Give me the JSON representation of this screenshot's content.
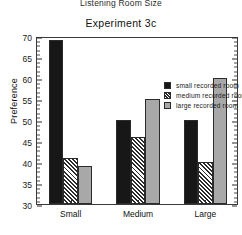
{
  "figure": {
    "supertitle": "Listening Room Size",
    "subtitle": "Experiment 3c"
  },
  "legend": {
    "position": "top-right-inside",
    "entries": [
      {
        "label": "small recorded room",
        "swatch": "black-filled-square-icon"
      },
      {
        "label": "medium recorded room",
        "swatch": "hatched-square-icon"
      },
      {
        "label": "large recorded room",
        "swatch": "gray-filled-square-icon"
      }
    ]
  },
  "axes": {
    "y": {
      "label": "Preference",
      "ticks": [
        "30",
        "35",
        "40",
        "45",
        "50",
        "55",
        "60",
        "65",
        "70"
      ],
      "min": 30,
      "max": 70
    },
    "x": {
      "label": "",
      "ticks": [
        "Small",
        "Medium",
        "Large"
      ]
    }
  },
  "colors": {
    "small_recorded_room": "#171717",
    "medium_recorded_room": "#2b2b2b",
    "large_recorded_room": "#a8a8a8",
    "axis": "#3a3a3a",
    "background": "#ffffff"
  },
  "chart_data": {
    "type": "bar",
    "title": "Experiment 3c",
    "subtitle": "Listening Room Size",
    "xlabel": "",
    "ylabel": "Preference",
    "ylim": [
      30,
      70
    ],
    "ytick_step": 5,
    "grid": false,
    "legend_position": "upper right inside",
    "categories": [
      "Small",
      "Medium",
      "Large"
    ],
    "series": [
      {
        "name": "small recorded room",
        "values": [
          69,
          50,
          50
        ]
      },
      {
        "name": "medium recorded room",
        "values": [
          41,
          46,
          40
        ]
      },
      {
        "name": "large recorded room",
        "values": [
          39,
          55,
          60
        ]
      }
    ]
  }
}
